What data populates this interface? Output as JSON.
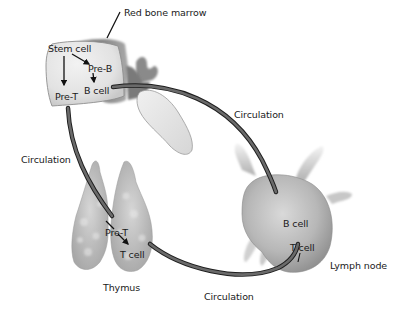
{
  "diagram": {
    "type": "biological-process",
    "colors": {
      "background": "#ffffff",
      "tissue_light": "#e6e6e6",
      "tissue_mid": "#c8c8c8",
      "tissue_dark": "#8c8c8c",
      "vessel": "#555555",
      "vessel_edge": "#1e1e1e",
      "text": "#1a1a1a"
    },
    "organs": [
      {
        "id": "red-bone-marrow",
        "label": "Red bone marrow"
      },
      {
        "id": "thymus",
        "label": "Thymus"
      },
      {
        "id": "lymph-node",
        "label": "Lymph node"
      }
    ],
    "cells": {
      "marrow": {
        "stem_cell": "Stem cell",
        "pre_b": "Pre-B",
        "b_cell": "B cell",
        "pre_t": "Pre-T"
      },
      "thymus": {
        "pre_t": "Pre-T",
        "t_cell": "T cell"
      },
      "lymph_node": {
        "b_cell": "B cell",
        "t_cell": "T cell"
      }
    },
    "circulation": {
      "left": "Circulation",
      "upper_right": "Circulation",
      "bottom": "Circulation"
    },
    "edges": [
      {
        "from": "Stem cell",
        "to": "Pre-B"
      },
      {
        "from": "Stem cell",
        "to": "Pre-T"
      },
      {
        "from": "Pre-B",
        "to": "B cell"
      },
      {
        "from": "B cell (marrow)",
        "to": "B cell (lymph node)",
        "via": "Circulation"
      },
      {
        "from": "Pre-T (marrow)",
        "to": "Pre-T (thymus)",
        "via": "Circulation"
      },
      {
        "from": "Pre-T (thymus)",
        "to": "T cell (thymus)"
      },
      {
        "from": "T cell (thymus)",
        "to": "T cell (lymph node)",
        "via": "Circulation"
      }
    ]
  }
}
